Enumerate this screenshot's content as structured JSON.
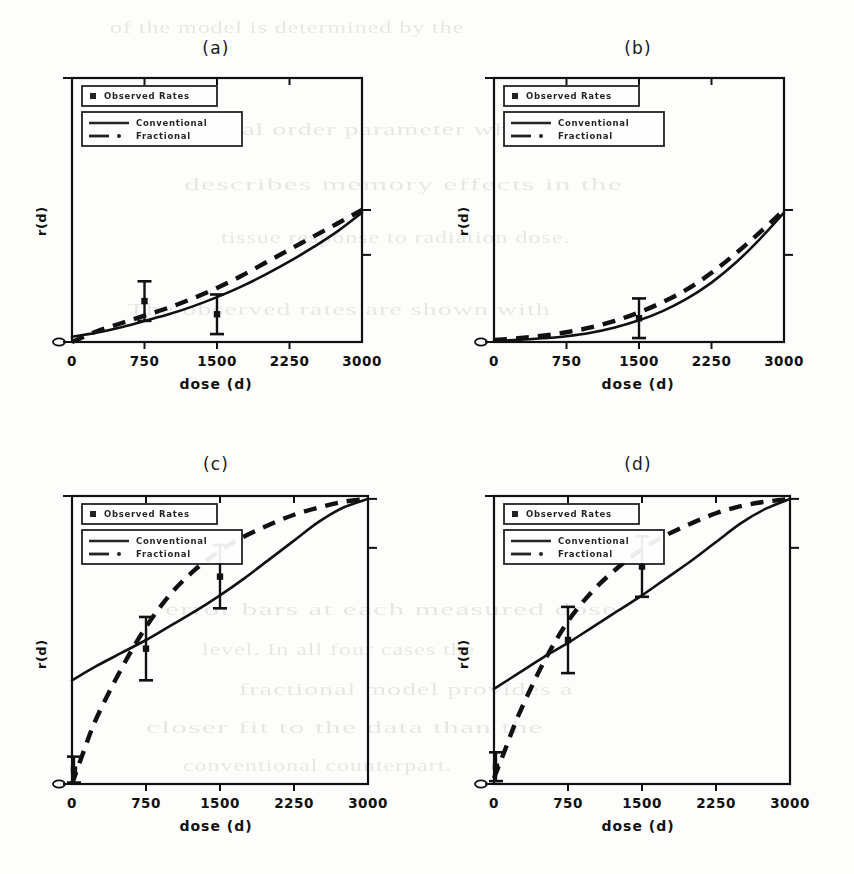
{
  "figure": {
    "ylabel": "r(d)",
    "xlabel": "dose (d)",
    "y_zero_label": "0",
    "xticks": [
      "0",
      "750",
      "1500",
      "2250",
      "3000"
    ],
    "legend": {
      "observed_label": "Observed Rates",
      "conventional_label": "Conventional",
      "fractional_label": "Fractional"
    },
    "panels": [
      {
        "label": "(a)"
      },
      {
        "label": "(b)"
      },
      {
        "label": "(c)"
      },
      {
        "label": "(d)"
      }
    ]
  },
  "colors": {
    "ink": "#111111",
    "paper": "#fdfdfb"
  },
  "background_text": [
    "of the model is determined by the",
    "fractional order parameter which",
    "describes memory effects in the",
    "tissue response to radiation dose.",
    "The observed rates are shown with",
    "error bars at each measured dose",
    "level. In all four cases the",
    "fractional model provides a",
    "closer fit to the data than the",
    "conventional counterpart."
  ],
  "chart_data": [
    {
      "type": "line",
      "title": "(a)",
      "xlabel": "dose (d)",
      "ylabel": "r(d)",
      "xlim": [
        0,
        3000
      ],
      "ylim": [
        0,
        1
      ],
      "xticks": [
        0,
        750,
        1500,
        2250,
        3000
      ],
      "yticks": [
        0,
        1
      ],
      "grid": false,
      "legend_position": "top-left",
      "series": [
        {
          "name": "Conventional",
          "style": "solid",
          "x": [
            0,
            250,
            500,
            750,
            1000,
            1250,
            1500,
            1750,
            2000,
            2250,
            2500,
            2750,
            3000
          ],
          "y": [
            0.02,
            0.035,
            0.055,
            0.08,
            0.105,
            0.135,
            0.17,
            0.21,
            0.255,
            0.305,
            0.36,
            0.42,
            0.49
          ]
        },
        {
          "name": "Fractional",
          "style": "dashed",
          "x": [
            0,
            250,
            500,
            750,
            1000,
            1250,
            1500,
            1750,
            2000,
            2250,
            2500,
            2750,
            3000
          ],
          "y": [
            0.0,
            0.04,
            0.07,
            0.1,
            0.13,
            0.165,
            0.205,
            0.25,
            0.3,
            0.35,
            0.4,
            0.45,
            0.5
          ]
        }
      ],
      "observed": [
        {
          "x": 750,
          "y": 0.155,
          "err_low": 0.075,
          "err_high": 0.075
        },
        {
          "x": 1500,
          "y": 0.105,
          "err_low": 0.075,
          "err_high": 0.075
        }
      ]
    },
    {
      "type": "line",
      "title": "(b)",
      "xlabel": "dose (d)",
      "ylabel": "r(d)",
      "xlim": [
        0,
        3000
      ],
      "ylim": [
        0,
        1
      ],
      "xticks": [
        0,
        750,
        1500,
        2250,
        3000
      ],
      "yticks": [
        0,
        1
      ],
      "grid": false,
      "legend_position": "top-left",
      "series": [
        {
          "name": "Conventional",
          "style": "solid",
          "x": [
            0,
            250,
            500,
            750,
            1000,
            1250,
            1500,
            1750,
            2000,
            2250,
            2500,
            2750,
            3000
          ],
          "y": [
            0.005,
            0.008,
            0.014,
            0.022,
            0.035,
            0.055,
            0.082,
            0.118,
            0.165,
            0.225,
            0.3,
            0.39,
            0.49
          ]
        },
        {
          "name": "Fractional",
          "style": "dashed",
          "x": [
            0,
            250,
            500,
            750,
            1000,
            1250,
            1500,
            1750,
            2000,
            2250,
            2500,
            2750,
            3000
          ],
          "y": [
            0.008,
            0.014,
            0.024,
            0.037,
            0.055,
            0.08,
            0.112,
            0.152,
            0.2,
            0.262,
            0.335,
            0.415,
            0.5
          ]
        }
      ],
      "observed": [
        {
          "x": 1500,
          "y": 0.09,
          "err_low": 0.075,
          "err_high": 0.075
        }
      ]
    },
    {
      "type": "line",
      "title": "(c)",
      "xlabel": "dose (d)",
      "ylabel": "r(d)",
      "xlim": [
        0,
        3000
      ],
      "ylim": [
        0,
        1
      ],
      "xticks": [
        0,
        750,
        1500,
        2250,
        3000
      ],
      "yticks": [
        0,
        1
      ],
      "grid": false,
      "legend_position": "top-left",
      "series": [
        {
          "name": "Conventional",
          "style": "solid",
          "x": [
            0,
            250,
            500,
            750,
            1000,
            1250,
            1500,
            1750,
            2000,
            2250,
            2500,
            2750,
            3000
          ],
          "y": [
            0.36,
            0.41,
            0.455,
            0.5,
            0.55,
            0.6,
            0.655,
            0.715,
            0.78,
            0.845,
            0.91,
            0.96,
            0.99
          ]
        },
        {
          "name": "Fractional",
          "style": "dashed",
          "x": [
            0,
            125,
            250,
            500,
            750,
            1000,
            1250,
            1500,
            1750,
            2000,
            2250,
            2500,
            2750,
            3000
          ],
          "y": [
            0.0,
            0.12,
            0.23,
            0.4,
            0.545,
            0.66,
            0.745,
            0.81,
            0.86,
            0.9,
            0.935,
            0.96,
            0.98,
            0.99
          ]
        }
      ],
      "observed": [
        {
          "x": 20,
          "y": 0.05,
          "err_low": 0.045,
          "err_high": 0.045
        },
        {
          "x": 750,
          "y": 0.47,
          "err_low": 0.11,
          "err_high": 0.11
        },
        {
          "x": 1500,
          "y": 0.72,
          "err_low": 0.11,
          "err_high": 0.11
        }
      ]
    },
    {
      "type": "line",
      "title": "(d)",
      "xlabel": "dose (d)",
      "ylabel": "r(d)",
      "xlim": [
        0,
        3000
      ],
      "ylim": [
        0,
        1
      ],
      "xticks": [
        0,
        750,
        1500,
        2250,
        3000
      ],
      "yticks": [
        0,
        1
      ],
      "grid": false,
      "legend_position": "top-left",
      "series": [
        {
          "name": "Conventional",
          "style": "solid",
          "x": [
            0,
            250,
            500,
            750,
            1000,
            1250,
            1500,
            1750,
            2000,
            2250,
            2500,
            2750,
            3000
          ],
          "y": [
            0.33,
            0.385,
            0.44,
            0.49,
            0.545,
            0.6,
            0.655,
            0.715,
            0.775,
            0.84,
            0.905,
            0.955,
            0.99
          ]
        },
        {
          "name": "Fractional",
          "style": "dashed",
          "x": [
            0,
            125,
            250,
            500,
            750,
            1000,
            1250,
            1500,
            1750,
            2000,
            2250,
            2500,
            2750,
            3000
          ],
          "y": [
            0.02,
            0.13,
            0.24,
            0.42,
            0.565,
            0.67,
            0.75,
            0.815,
            0.865,
            0.905,
            0.94,
            0.965,
            0.98,
            0.99
          ]
        }
      ],
      "observed": [
        {
          "x": 20,
          "y": 0.06,
          "err_low": 0.05,
          "err_high": 0.05
        },
        {
          "x": 750,
          "y": 0.5,
          "err_low": 0.115,
          "err_high": 0.115
        },
        {
          "x": 1500,
          "y": 0.755,
          "err_low": 0.105,
          "err_high": 0.105
        }
      ]
    }
  ]
}
